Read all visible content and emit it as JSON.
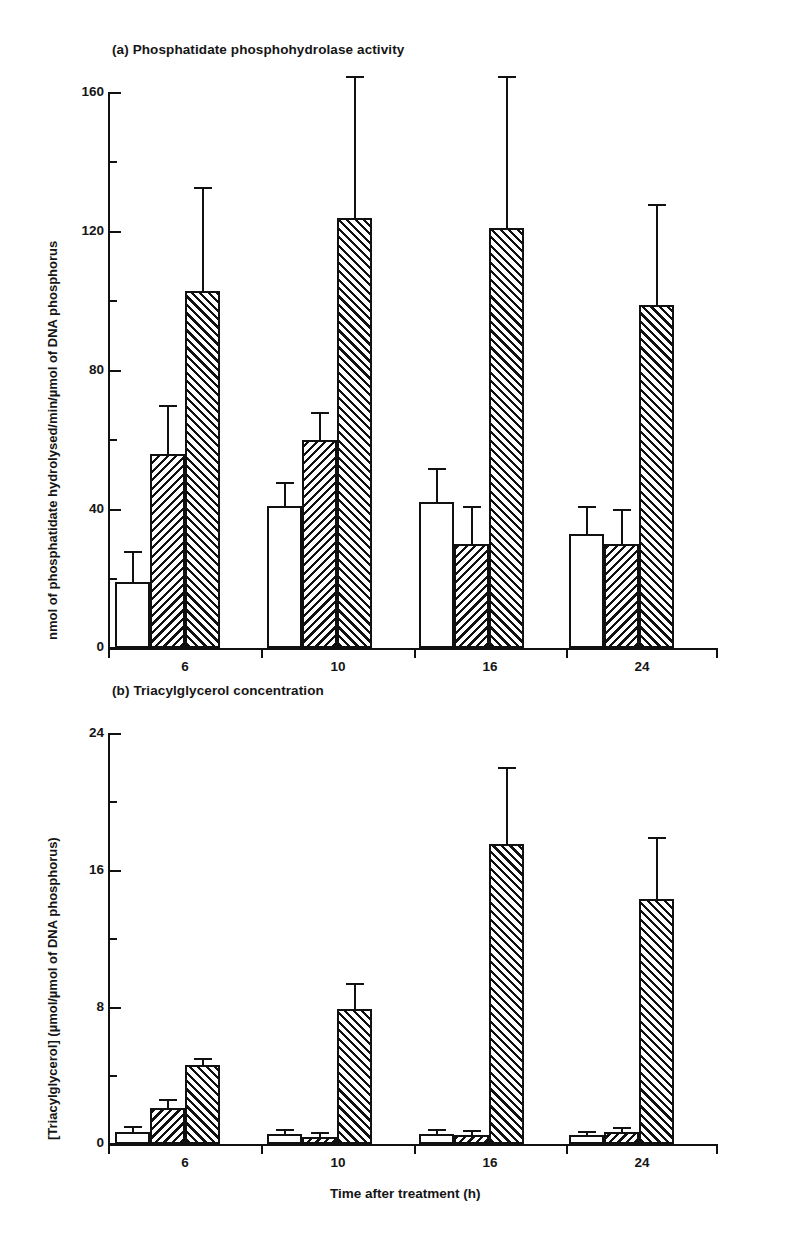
{
  "figure": {
    "panels": [
      {
        "id": "a",
        "title": "(a) Phosphatidate phosphohydrolase activity",
        "ylabel": "nmol of phosphatidate hydrolysed/min/µmol of DNA phosphorus",
        "xlabel": "",
        "ytick_labels": [
          "0",
          "40",
          "80",
          "120",
          "160"
        ],
        "xtick_labels": [
          "6",
          "10",
          "16",
          "24"
        ]
      },
      {
        "id": "b",
        "title": "(b) Triacylglycerol concentration",
        "ylabel": "[Triacylglycerol] (µmol/µmol of DNA phosphorus)",
        "xlabel": "Time after treatment (h)",
        "ytick_labels": [
          "0",
          "8",
          "16",
          "24"
        ],
        "xtick_labels": [
          "6",
          "10",
          "16",
          "24"
        ]
      }
    ]
  },
  "chart_data": [
    {
      "type": "bar",
      "panel": "a",
      "title": "(a) Phosphatidate phosphohydrolase activity",
      "xlabel": "",
      "ylabel": "nmol of phosphatidate hydrolysed/min/µmol of DNA phosphorus",
      "categories": [
        "6",
        "10",
        "16",
        "24"
      ],
      "ylim": [
        0,
        160
      ],
      "ytick_major": [
        0,
        40,
        80,
        120,
        160
      ],
      "ytick_minor": [
        20,
        60,
        100,
        140
      ],
      "grid": false,
      "legend": "none",
      "series": [
        {
          "name": "open",
          "fill": "white",
          "values": [
            19,
            41,
            42,
            33
          ],
          "errors": [
            9,
            7,
            10,
            8
          ]
        },
        {
          "name": "hatched-backslash",
          "fill": "hatch-back",
          "values": [
            56,
            60,
            30,
            30
          ],
          "errors": [
            14,
            8,
            11,
            10
          ]
        },
        {
          "name": "hatched-forwardslash",
          "fill": "hatch-fwd",
          "values": [
            103,
            124,
            121,
            99
          ],
          "errors": [
            30,
            41,
            44,
            29
          ]
        }
      ]
    },
    {
      "type": "bar",
      "panel": "b",
      "title": "(b) Triacylglycerol concentration",
      "xlabel": "Time after treatment (h)",
      "ylabel": "[Triacylglycerol] (µmol/µmol of DNA phosphorus)",
      "categories": [
        "6",
        "10",
        "16",
        "24"
      ],
      "ylim": [
        0,
        24
      ],
      "ytick_major": [
        0,
        8,
        16,
        24
      ],
      "ytick_minor": [
        4,
        12,
        20
      ],
      "grid": false,
      "legend": "none",
      "series": [
        {
          "name": "open",
          "fill": "white",
          "values": [
            0.7,
            0.6,
            0.6,
            0.5
          ],
          "errors": [
            0.35,
            0.3,
            0.3,
            0.25
          ]
        },
        {
          "name": "hatched-backslash",
          "fill": "hatch-back",
          "values": [
            2.1,
            0.4,
            0.5,
            0.7
          ],
          "errors": [
            0.5,
            0.3,
            0.3,
            0.3
          ]
        },
        {
          "name": "hatched-forwardslash",
          "fill": "hatch-fwd",
          "values": [
            4.6,
            7.9,
            17.5,
            14.3
          ],
          "errors": [
            0.4,
            1.5,
            4.5,
            3.6
          ]
        }
      ]
    }
  ],
  "colors": {
    "ink": "#111111",
    "background": "#ffffff"
  }
}
